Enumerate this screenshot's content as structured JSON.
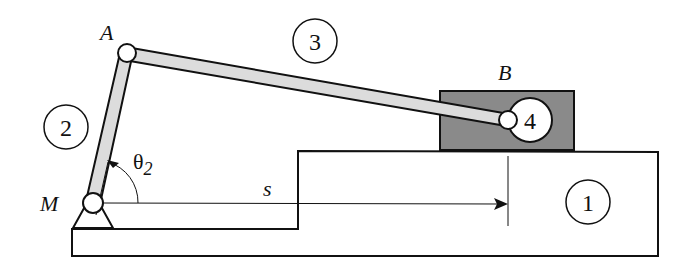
{
  "diagram": {
    "type": "slider-crank mechanism",
    "points": {
      "A": "A",
      "B": "B",
      "M": "M"
    },
    "links": {
      "ground": "1",
      "crank": "2",
      "coupler": "3",
      "slider": "4"
    },
    "angle_label": "θ",
    "angle_subscript": "2",
    "displacement_label": "s",
    "colors": {
      "link_fill": "#dcdcdc",
      "slider_fill": "#8a8a8a",
      "stroke": "#111111"
    }
  }
}
